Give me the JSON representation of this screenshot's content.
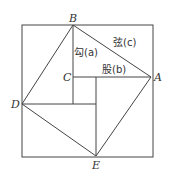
{
  "diagram": {
    "title": "",
    "points": {
      "A": "A",
      "B": "B",
      "C": "C",
      "D": "D",
      "E": "E"
    },
    "labels": {
      "gou": "勾(a)",
      "xian": "弦(c)",
      "gu": "股(b)"
    },
    "colors": {
      "line": "#444444",
      "text": "#333333",
      "background": "#ffffff"
    }
  }
}
